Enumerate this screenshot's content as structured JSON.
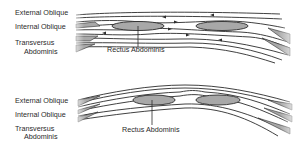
{
  "figure": {
    "panels": [
      {
        "id": "top",
        "labels": {
          "external_oblique": "External Oblique",
          "internal_oblique": "Internal Oblique",
          "transversus_line1": "Transversus",
          "transversus_line2": "Abdominis",
          "rectus": "Rectus Abdominis"
        }
      },
      {
        "id": "bottom",
        "labels": {
          "external_oblique": "External Oblique",
          "internal_oblique": "Internal Oblique",
          "transversus_line1": "Transversus",
          "transversus_line2": "Abdominis",
          "rectus": "Rectus Abdominis"
        }
      }
    ],
    "colors": {
      "muscle_fill": "#a8a8a8",
      "outline": "#2b2b2b",
      "background": "#ffffff"
    }
  }
}
